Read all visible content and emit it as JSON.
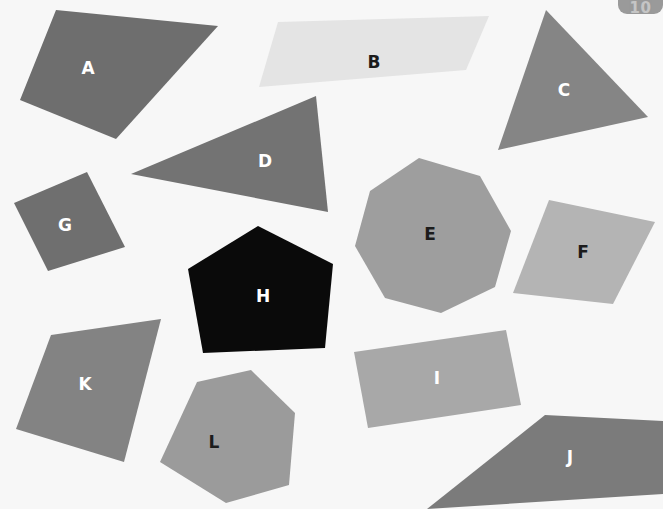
{
  "canvas": {
    "width": 663,
    "height": 509,
    "background_color": "#f7f7f7"
  },
  "corner_badge": {
    "text": "10",
    "background_color": "#9a9a9a",
    "text_color": "#e9e9e9",
    "left": 618,
    "top": -12,
    "width": 45,
    "height": 26
  },
  "shapes": [
    {
      "id": "shape-a",
      "label": "A",
      "kind": "quadrilateral",
      "fill": "#6e6e6e",
      "label_color": "#ffffff",
      "points": "56,10 218,26 116,139 20,100",
      "label_x": 88,
      "label_y": 68
    },
    {
      "id": "shape-b",
      "label": "B",
      "kind": "parallelogram",
      "fill": "#e4e4e4",
      "label_color": "#1c1c1c",
      "points": "278,22 489,16 466,70 259,87",
      "label_x": 374,
      "label_y": 62
    },
    {
      "id": "shape-c",
      "label": "C",
      "kind": "triangle",
      "fill": "#858585",
      "label_color": "#ffffff",
      "points": "546,10 648,117 498,150",
      "label_x": 564,
      "label_y": 90
    },
    {
      "id": "shape-d",
      "label": "D",
      "kind": "triangle",
      "fill": "#737373",
      "label_color": "#ffffff",
      "points": "316,96 328,212 131,174",
      "label_x": 265,
      "label_y": 161
    },
    {
      "id": "shape-e",
      "label": "E",
      "kind": "octagon",
      "fill": "#9e9e9e",
      "label_color": "#1c1c1c",
      "points": "419,158 480,176 511,231 495,287 441,313 385,298 355,246 370,191",
      "label_x": 430,
      "label_y": 234
    },
    {
      "id": "shape-f",
      "label": "F",
      "kind": "quadrilateral",
      "fill": "#b4b4b4",
      "label_color": "#1c1c1c",
      "points": "549,200 655,222 613,304 513,293",
      "label_x": 583,
      "label_y": 252
    },
    {
      "id": "shape-g",
      "label": "G",
      "kind": "quadrilateral",
      "fill": "#6f6f6f",
      "label_color": "#ffffff",
      "points": "87,172 125,247 48,271 14,203",
      "label_x": 65,
      "label_y": 225
    },
    {
      "id": "shape-h",
      "label": "H",
      "kind": "pentagon",
      "fill": "#0a0a0a",
      "label_color": "#ffffff",
      "points": "258,226 333,264 325,348 203,353 188,269",
      "label_x": 263,
      "label_y": 296
    },
    {
      "id": "shape-i",
      "label": "I",
      "kind": "quadrilateral",
      "fill": "#a8a8a8",
      "label_color": "#ffffff",
      "points": "506,330 521,405 368,428 354,352",
      "label_x": 437,
      "label_y": 378
    },
    {
      "id": "shape-j",
      "label": "J",
      "kind": "quadrilateral",
      "fill": "#7b7b7b",
      "label_color": "#ffffff",
      "points": "545,415 663,421 663,494 427,509",
      "label_x": 570,
      "label_y": 457
    },
    {
      "id": "shape-k",
      "label": "K",
      "kind": "quadrilateral",
      "fill": "#838383",
      "label_color": "#ffffff",
      "points": "51,335 161,319 124,462 16,429",
      "label_x": 85,
      "label_y": 384
    },
    {
      "id": "shape-l",
      "label": "L",
      "kind": "hexagon",
      "fill": "#9b9b9b",
      "label_color": "#1c1c1c",
      "points": "197,382 251,370 295,413 289,485 226,503 160,462",
      "label_x": 214,
      "label_y": 442
    }
  ]
}
